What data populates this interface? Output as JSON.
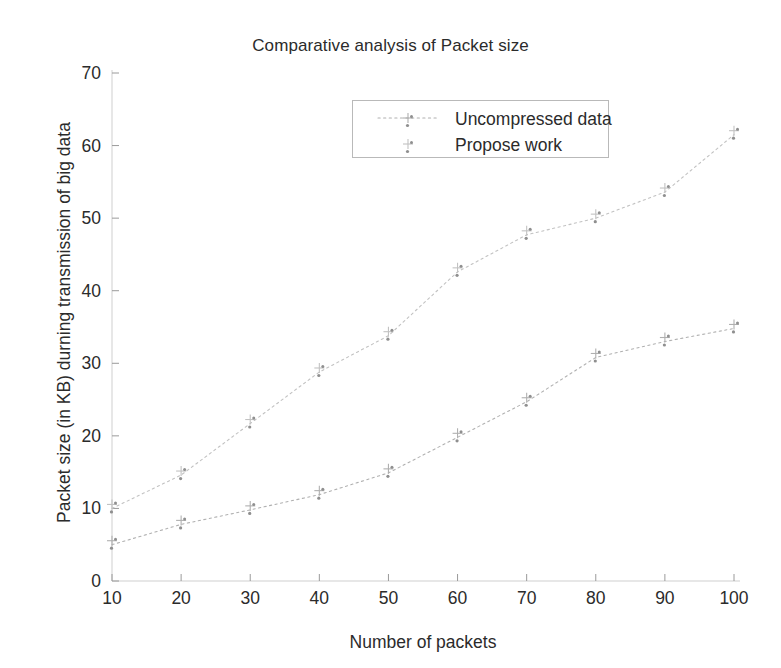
{
  "chart_data": {
    "type": "line",
    "title": "Comparative analysis of Packet size",
    "xlabel": "Number of packets",
    "ylabel": "Packet size (in KB) durning transmission of big data",
    "x": [
      10,
      20,
      30,
      40,
      50,
      60,
      70,
      80,
      90,
      100
    ],
    "xtick_labels": [
      "10",
      "20",
      "30",
      "40",
      "50",
      "60",
      "70",
      "80",
      "90",
      "100"
    ],
    "ytick_labels": [
      "0",
      "10",
      "20",
      "30",
      "40",
      "50",
      "60",
      "70"
    ],
    "yticks": [
      0,
      10,
      20,
      30,
      40,
      50,
      60,
      70
    ],
    "xlim": [
      10,
      100
    ],
    "ylim": [
      0,
      70
    ],
    "grid": false,
    "legend_position": "upper center",
    "series": [
      {
        "name": "Uncompressed data",
        "color": "#b0b0b0",
        "marker": "plus-dot",
        "values": [
          5.0,
          7.8,
          9.8,
          11.9,
          14.9,
          19.8,
          24.7,
          30.8,
          33.0,
          34.8
        ]
      },
      {
        "name": "Propose work",
        "color": "#c2c2c2",
        "marker": "plus-dot",
        "values": [
          10.0,
          14.6,
          21.7,
          28.8,
          33.8,
          42.6,
          47.7,
          50.0,
          53.6,
          61.5
        ]
      }
    ]
  },
  "legend": {
    "entries": [
      {
        "label": "Uncompressed data"
      },
      {
        "label": "Propose work"
      }
    ]
  },
  "colors": {
    "background": "#ffffff",
    "text": "#2b2b2b",
    "axis": "#cfcfcf",
    "series_uncompressed": "#b0b0b0",
    "series_propose": "#c2c2c2",
    "legend_border": "#b9b9b9"
  }
}
